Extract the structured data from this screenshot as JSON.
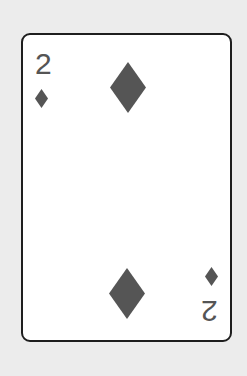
{
  "card": {
    "rank": "2",
    "suit": "diamonds",
    "suit_icon": "diamond-icon",
    "pip_count": 2,
    "colors": {
      "background": "#ececec",
      "face": "#ffffff",
      "border": "#1e1e1e",
      "ink": "#555555"
    }
  }
}
